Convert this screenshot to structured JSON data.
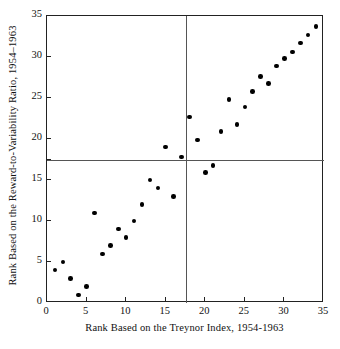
{
  "chart_data": {
    "type": "scatter",
    "title": "",
    "xlabel": "Rank Based on the Treynor Index, 1954-1963",
    "ylabel": "Rank Based on the Reward-to-Variability Ratio, 1954–1963",
    "xlim": [
      0,
      35
    ],
    "ylim": [
      0,
      35
    ],
    "xticks": [
      0,
      5,
      10,
      15,
      20,
      25,
      30,
      35
    ],
    "yticks": [
      0,
      5,
      10,
      15,
      20,
      25,
      30,
      35
    ],
    "xticklabels": [
      "0",
      "5",
      "10",
      "15",
      "20",
      "25",
      "30",
      "35"
    ],
    "yticklabels": [
      "0",
      "5",
      "10",
      "15",
      "20",
      "25",
      "30",
      "35"
    ],
    "grid": false,
    "legend": null,
    "median_lines": {
      "x": 17.5,
      "y": 17.5
    },
    "points": [
      {
        "x": 1,
        "y": 4
      },
      {
        "x": 2,
        "y": 5
      },
      {
        "x": 3,
        "y": 3
      },
      {
        "x": 4,
        "y": 1
      },
      {
        "x": 5,
        "y": 2
      },
      {
        "x": 6,
        "y": 11
      },
      {
        "x": 7,
        "y": 6
      },
      {
        "x": 8,
        "y": 7
      },
      {
        "x": 9,
        "y": 9
      },
      {
        "x": 10,
        "y": 8
      },
      {
        "x": 11,
        "y": 10
      },
      {
        "x": 12,
        "y": 12
      },
      {
        "x": 13,
        "y": 15
      },
      {
        "x": 14,
        "y": 14
      },
      {
        "x": 15,
        "y": 19
      },
      {
        "x": 16,
        "y": 13
      },
      {
        "x": 17,
        "y": 17.8
      },
      {
        "x": 18,
        "y": 22.7
      },
      {
        "x": 19,
        "y": 19.9
      },
      {
        "x": 20,
        "y": 15.9
      },
      {
        "x": 21,
        "y": 16.8
      },
      {
        "x": 22,
        "y": 20.9
      },
      {
        "x": 23,
        "y": 24.8
      },
      {
        "x": 24,
        "y": 21.8
      },
      {
        "x": 25,
        "y": 23.9
      },
      {
        "x": 26,
        "y": 25.8
      },
      {
        "x": 27,
        "y": 27.6
      },
      {
        "x": 28,
        "y": 26.8
      },
      {
        "x": 29,
        "y": 28.9
      },
      {
        "x": 30,
        "y": 29.8
      },
      {
        "x": 31,
        "y": 30.6
      },
      {
        "x": 32,
        "y": 31.7
      },
      {
        "x": 33,
        "y": 32.7
      },
      {
        "x": 34,
        "y": 33.7
      }
    ]
  }
}
